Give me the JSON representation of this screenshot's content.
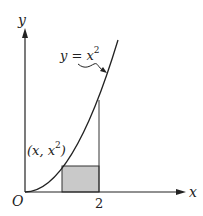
{
  "diagram": {
    "type": "function-graph",
    "function": "y = x^2",
    "labels": {
      "y_axis": "y",
      "x_axis": "x",
      "origin": "O",
      "curve_eq_lhs": "y = x",
      "curve_eq_exp": "2",
      "point_open": "(x, x",
      "point_exp": "2",
      "point_close": ")",
      "x_tick": "2"
    },
    "shaded_rectangle": {
      "x_from": 1,
      "x_to": 2,
      "height": 1,
      "fill": "#c9c9c9"
    },
    "vertical_line_at": 2,
    "colors": {
      "line": "#222222",
      "background": "#ffffff",
      "shade": "#c9c9c9"
    }
  }
}
